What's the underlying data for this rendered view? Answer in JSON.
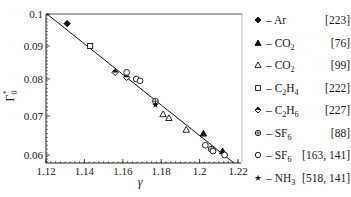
{
  "chart_data": {
    "type": "scatter",
    "title": "",
    "xlabel": "γ",
    "ylabel": "Γ₀*",
    "xlim": [
      1.12,
      1.22
    ],
    "ylim": [
      0.057,
      0.1
    ],
    "x_ticks": [
      "1.12",
      "1.14",
      "1.16",
      "1.18",
      "1.2",
      "1.22"
    ],
    "y_ticks": [
      "0.1",
      "0.09",
      "0.08",
      "0.07",
      "0.06"
    ],
    "grid": false,
    "legend_position": "right",
    "fit_line": {
      "x": [
        1.121,
        1.218
      ],
      "y": [
        0.1,
        0.0575
      ]
    },
    "series": [
      {
        "name": "Ar",
        "ref": "[223]",
        "marker": "filled-diamond",
        "points": [
          [
            1.131,
            0.097
          ]
        ]
      },
      {
        "name": "CO2",
        "ref": "[76]",
        "marker": "filled-triangle",
        "points": [
          [
            1.202,
            0.0655
          ],
          [
            1.212,
            0.061
          ]
        ]
      },
      {
        "name": "CO2",
        "ref": "[99]",
        "marker": "open-triangle",
        "points": [
          [
            1.181,
            0.0705
          ],
          [
            1.184,
            0.0695
          ],
          [
            1.193,
            0.0665
          ]
        ]
      },
      {
        "name": "C2H4",
        "ref": "[222]",
        "marker": "open-square",
        "points": [
          [
            1.143,
            0.09
          ]
        ]
      },
      {
        "name": "C2H6",
        "ref": "[227]",
        "marker": "half-filled-diamond",
        "points": [
          [
            1.156,
            0.082
          ],
          [
            1.162,
            0.0805
          ]
        ]
      },
      {
        "name": "SF6",
        "ref": "[88]",
        "marker": "circle-plus",
        "points": [
          [
            1.177,
            0.074
          ],
          [
            1.206,
            0.0615
          ]
        ]
      },
      {
        "name": "SF6",
        "ref": "[163, 141]",
        "marker": "open-circle",
        "points": [
          [
            1.162,
            0.082
          ],
          [
            1.167,
            0.08
          ],
          [
            1.169,
            0.0795
          ],
          [
            1.203,
            0.0625
          ],
          [
            1.207,
            0.061
          ],
          [
            1.213,
            0.06
          ]
        ]
      },
      {
        "name": "NH3",
        "ref": "[518, 141]",
        "marker": "filled-star",
        "points": [
          [
            1.177,
            0.073
          ]
        ]
      }
    ]
  },
  "legend": [
    {
      "marker": "filled-diamond",
      "label_main": "– Ar",
      "label_sub": "",
      "label_tail": "",
      "ref": "[223]"
    },
    {
      "marker": "filled-triangle",
      "label_main": "– CO",
      "label_sub": "2",
      "label_tail": "",
      "ref": "[76]"
    },
    {
      "marker": "open-triangle",
      "label_main": "– CO",
      "label_sub": "2",
      "label_tail": "",
      "ref": "[99]"
    },
    {
      "marker": "open-square",
      "label_main": "– C",
      "label_sub": "2",
      "label_tail": "H",
      "label_sub2": "4",
      "ref": "[222]"
    },
    {
      "marker": "half-filled-diamond",
      "label_main": "– C",
      "label_sub": "2",
      "label_tail": "H",
      "label_sub2": "6",
      "ref": "[227]"
    },
    {
      "marker": "circle-plus",
      "label_main": "– SF",
      "label_sub": "6",
      "label_tail": "",
      "ref": "[88]"
    },
    {
      "marker": "open-circle",
      "label_main": "– SF",
      "label_sub": "6",
      "label_tail": "",
      "ref": "[163, 141]"
    },
    {
      "marker": "filled-star",
      "label_main": "– NH",
      "label_sub": "3",
      "label_tail": "",
      "ref": "[518, 141]"
    }
  ]
}
